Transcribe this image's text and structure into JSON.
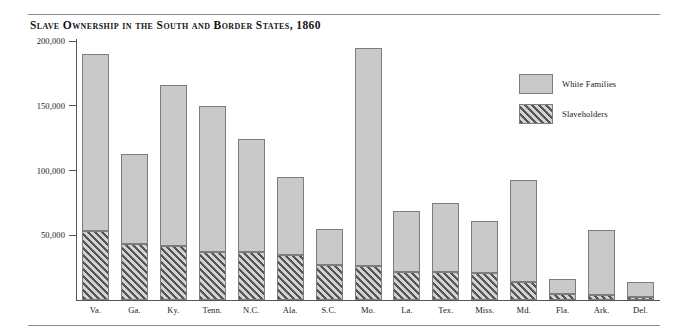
{
  "chart_data": {
    "type": "bar",
    "subtype": "stacked",
    "title": "Slave Ownership in the South and Border States, 1860",
    "xlabel": "",
    "ylabel": "",
    "ylim": [
      0,
      200000
    ],
    "grid": false,
    "legend_position": "right",
    "yticks": [
      {
        "value": 200000,
        "label": "200,000"
      },
      {
        "value": 150000,
        "label": "150,000"
      },
      {
        "value": 100000,
        "label": "100,000"
      },
      {
        "value": 50000,
        "label": "50,000"
      }
    ],
    "categories": [
      "Va.",
      "Ga.",
      "Ky.",
      "Tenn.",
      "N.C.",
      "Ala.",
      "S.C.",
      "Mo.",
      "La.",
      "Tex.",
      "Miss.",
      "Md.",
      "Fla.",
      "Ark.",
      "Del."
    ],
    "series": [
      {
        "name": "White Families",
        "color": "#c9c9c9",
        "pattern": "solid",
        "values": [
          190000,
          113000,
          166000,
          150000,
          124000,
          95000,
          55000,
          195000,
          69000,
          75000,
          61000,
          93000,
          16000,
          54000,
          14000
        ]
      },
      {
        "name": "Slaveholders",
        "color": "#555555",
        "pattern": "diagonal-hatch",
        "values": [
          53000,
          43000,
          42000,
          37000,
          37000,
          35000,
          27000,
          26000,
          22000,
          22000,
          21000,
          14000,
          5000,
          3500,
          2000
        ]
      }
    ]
  },
  "legend": {
    "items": [
      {
        "label": "White Families",
        "pattern": "solid"
      },
      {
        "label": "Slaveholders",
        "pattern": "diagonal-hatch"
      }
    ]
  }
}
